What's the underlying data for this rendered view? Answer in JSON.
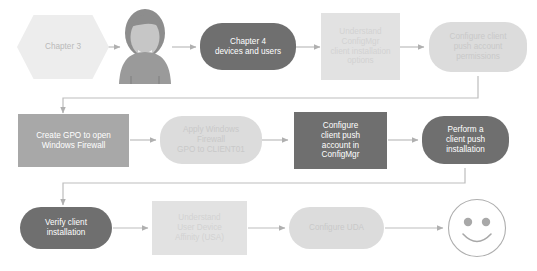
{
  "diagram": {
    "colors": {
      "pill_dark": "#6f6f6f",
      "pill_light": "#dcdcdc",
      "rect_mid": "#a8a8a8",
      "rect_dark": "#6f6f6f",
      "rect_light": "#e2e2e2",
      "hex_light": "#ededed",
      "connector": "#bdbdbd",
      "background": "#ffffff"
    },
    "rows": [
      {
        "row_index": 1,
        "nodes": [
          {
            "id": "chapter-3",
            "label": "Chapter 3",
            "shape": "hexagon"
          },
          {
            "id": "user-avatar",
            "label": "",
            "shape": "avatar-icon"
          },
          {
            "id": "chapter-4",
            "label": "Chapter 4\ndevices and users",
            "shape": "pill-dark"
          },
          {
            "id": "understand-configmgr",
            "label": "Understand\nConfigMgr\nclient installation\noptions",
            "shape": "rect-light"
          },
          {
            "id": "configure-push-perms",
            "label": "Configure client\npush account\npermissions",
            "shape": "pill-light"
          }
        ]
      },
      {
        "row_index": 2,
        "nodes": [
          {
            "id": "create-gpo",
            "label": "Create GPO to open\nWindows Firewall",
            "shape": "rect-mid"
          },
          {
            "id": "apply-gpo",
            "label": "Apply Windows\nFirewall\nGPO to CLIENT01",
            "shape": "pill-light"
          },
          {
            "id": "configure-push-acct",
            "label": "Configure\nclient push\naccount in\nConfigMgr",
            "shape": "rect-dark"
          },
          {
            "id": "perform-push",
            "label": "Perform a\nclient push\ninstallation",
            "shape": "pill-dark"
          }
        ]
      },
      {
        "row_index": 3,
        "nodes": [
          {
            "id": "verify-client",
            "label": "Verify client\ninstallation",
            "shape": "pill-dark"
          },
          {
            "id": "understand-uda",
            "label": "Understand\nUser Device\nAffinity (USA)",
            "shape": "rect-light"
          },
          {
            "id": "configure-uda",
            "label": "Configure UDA",
            "shape": "pill-light"
          },
          {
            "id": "smiley-end",
            "label": "",
            "shape": "smiley-icon"
          }
        ]
      }
    ],
    "icons": {
      "avatar": "person-avatar-icon",
      "smiley": "smiley-face-icon",
      "arrow": "arrow-right-icon"
    }
  }
}
